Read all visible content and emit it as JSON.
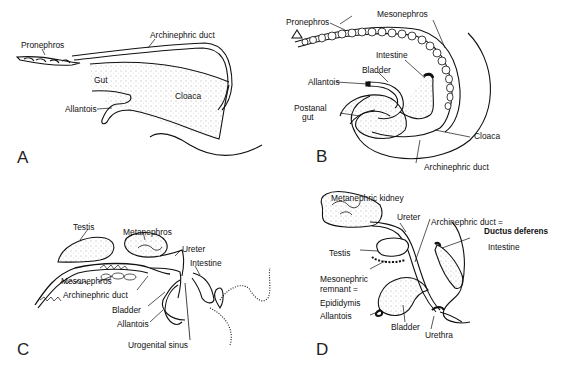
{
  "figure": {
    "panels": [
      {
        "letter": "A",
        "labels": {
          "pronephros": "Pronephros",
          "archinephric_duct": "Archinephric duct",
          "gut": "Gut",
          "allantois": "Allantois",
          "cloaca": "Cloaca"
        }
      },
      {
        "letter": "B",
        "labels": {
          "pronephros": "Pronephros",
          "mesonephros": "Mesonephros",
          "intestine": "Intestine",
          "bladder": "Bladder",
          "allantois": "Allantois",
          "postanal_gut_1": "Postanal",
          "postanal_gut_2": "gut",
          "cloaca": "Cloaca",
          "archinephric_duct": "Archinephric duct"
        }
      },
      {
        "letter": "C",
        "labels": {
          "testis": "Testis",
          "metanephros": "Metanephros",
          "ureter": "Ureter",
          "intestine": "Intestine",
          "mesonephros": "Mesonephros",
          "archinephric_duct": "Archinephric duct",
          "bladder": "Bladder",
          "allantois": "Allantois",
          "urogenital_sinus": "Urogenital sinus"
        }
      },
      {
        "letter": "D",
        "labels": {
          "metanephric_kidney": "Metanephric kidney",
          "ureter": "Ureter",
          "archinephric_duct": "Archinephric duct =",
          "ductus_deferens": "Ductus deferens",
          "intestine": "Intestine",
          "testis": "Testis",
          "mesonephric_remnant_1": "Mesonephric",
          "mesonephric_remnant_2": "remnant =",
          "epididymis": "Epididymis",
          "allantois": "Allantois",
          "bladder": "Bladder",
          "urethra": "Urethra"
        }
      }
    ]
  }
}
